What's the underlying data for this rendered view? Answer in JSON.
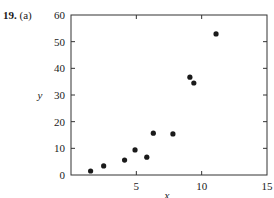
{
  "problem": {
    "number": "19.",
    "part": "(a)"
  },
  "chart_data": {
    "type": "scatter",
    "title": "",
    "xlabel": "x",
    "ylabel": "y",
    "xlim": [
      0,
      15
    ],
    "ylim": [
      0,
      60
    ],
    "xticks": [
      5,
      10,
      15
    ],
    "yticks": [
      0,
      10,
      20,
      30,
      40,
      50,
      60
    ],
    "grid": false,
    "legend": null,
    "points": [
      {
        "x": 1.5,
        "y": 1.5
      },
      {
        "x": 2.5,
        "y": 3.4
      },
      {
        "x": 4.1,
        "y": 5.6
      },
      {
        "x": 4.9,
        "y": 9.4
      },
      {
        "x": 5.8,
        "y": 6.7
      },
      {
        "x": 6.3,
        "y": 15.7
      },
      {
        "x": 7.8,
        "y": 15.4
      },
      {
        "x": 9.1,
        "y": 36.7
      },
      {
        "x": 9.4,
        "y": 34.5
      },
      {
        "x": 11.1,
        "y": 52.9
      }
    ],
    "marker_color": "#1a1a1a"
  }
}
